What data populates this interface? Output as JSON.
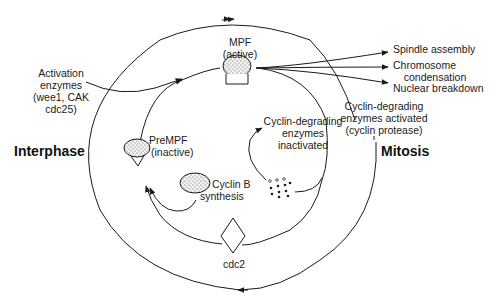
{
  "diagram": {
    "phases": {
      "interphase": "Interphase",
      "mitosis": "Mitosis"
    },
    "nodes": {
      "mpf": {
        "line1": "MPF",
        "line2": "(active)"
      },
      "prempf": {
        "line1": "PreMPF",
        "line2": "(inactive)"
      },
      "cyclin_b": {
        "line1": "Cyclin B",
        "line2": "synthesis"
      },
      "cdc2": {
        "label": "cdc2"
      }
    },
    "annotations": {
      "activation_enzymes": {
        "line1": "Activation",
        "line2": "enzymes",
        "line3": "(wee1, CAK",
        "line4": "cdc25)"
      },
      "cyclin_degrading_inactivated": {
        "line1": "Cyclin-degrading",
        "line2": "enzymes",
        "line3": "inactivated"
      },
      "cyclin_degrading_activated": {
        "line1": "Cyclin-degrading",
        "line2": "enzymes activated",
        "line3": "(cyclin protease)"
      }
    },
    "outputs": {
      "spindle": "Spindle assembly",
      "chromosome_line1": "Chromosome",
      "chromosome_line2": "condensation",
      "nuclear": "Nuclear breakdown"
    },
    "colors": {
      "stroke": "#1a1a1a",
      "background": "#ffffff",
      "stipple": "#d9d9d9"
    }
  }
}
